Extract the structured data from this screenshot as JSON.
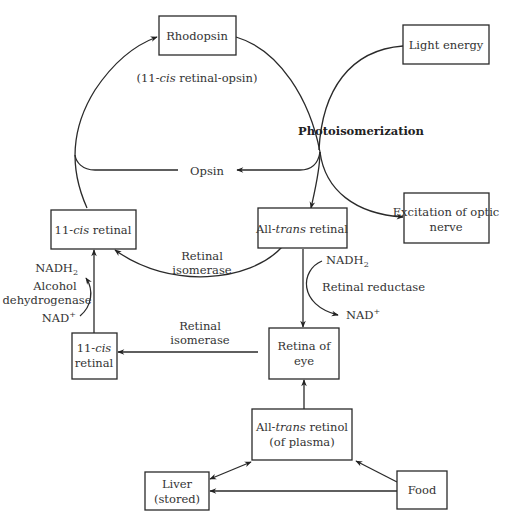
{
  "diagram": {
    "nodes": {
      "rhodopsin": {
        "label": "Rhodopsin",
        "sublabel_pre": "(11-",
        "sublabel_ital": "cis",
        "sublabel_post": " retinal-opsin)"
      },
      "light_energy": {
        "label": "Light energy"
      },
      "cis_retinal_top": {
        "pre": "11-",
        "ital": "cis",
        "post": " retinal"
      },
      "all_trans_retinal": {
        "pre": "All-",
        "ital": "trans",
        "post": " retinal"
      },
      "excitation": {
        "line1": "Excitation of optic",
        "line2": "nerve"
      },
      "cis_retinal_small": {
        "pre": "11-",
        "ital": "cis",
        "line2": "retinal"
      },
      "retina_of_eye": {
        "line1": "Retina of",
        "line2": "eye"
      },
      "all_trans_retinol": {
        "pre": "All-",
        "ital": "trans",
        "post": " retinol",
        "line2": "(of plasma)"
      },
      "liver": {
        "line1": "Liver",
        "line2": "(stored)"
      },
      "food": {
        "label": "Food"
      }
    },
    "labels": {
      "opsin": "Opsin",
      "photoisomerization": "Photoisomerization",
      "retinal_isomerase_1_l1": "Retinal",
      "retinal_isomerase_1_l2": "isomerase",
      "retinal_isomerase_2_l1": "Retinal",
      "retinal_isomerase_2_l2": "isomerase",
      "nadh2_left": "NADH",
      "nadh2_left_sub": "2",
      "alcohol_l1": "Alcohol",
      "alcohol_l2": "dehydrogenase",
      "nad_left": "NAD",
      "nad_left_sup": "+",
      "nadh2_right": "NADH",
      "nadh2_right_sub": "2",
      "retinal_reductase": "Retinal reductase",
      "nad_right": "NAD",
      "nad_right_sup": "+"
    }
  }
}
